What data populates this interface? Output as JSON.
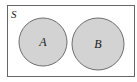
{
  "diagram": {
    "type": "venn",
    "universe": {
      "label": "S",
      "x": 7,
      "y": 5,
      "width": 128,
      "height": 72,
      "stroke": "#666666",
      "fill": "#ffffff"
    },
    "sets": [
      {
        "label": "A",
        "cx": 43,
        "cy": 42,
        "r": 24,
        "fill": "#d3d3d3",
        "stroke": "#6e6e6e"
      },
      {
        "label": "B",
        "cx": 98,
        "cy": 44,
        "r": 26,
        "fill": "#d3d3d3",
        "stroke": "#6e6e6e"
      }
    ],
    "relationship": "disjoint"
  }
}
